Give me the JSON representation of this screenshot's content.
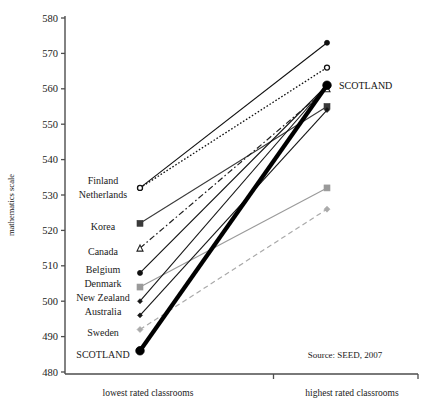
{
  "chart_data": {
    "type": "line",
    "title": "",
    "subtitle": "",
    "xlabel": "",
    "ylabel": "mathematics scale",
    "categories": [
      "lowest rated classrooms",
      "highest rated classrooms"
    ],
    "x": [
      0,
      1
    ],
    "ylim": [
      480,
      580
    ],
    "yticks": [
      480,
      490,
      500,
      510,
      520,
      530,
      540,
      550,
      560,
      570,
      580
    ],
    "ytick_labels": [
      "480",
      "490",
      "500",
      "510",
      "520",
      "530",
      "540",
      "550",
      "560",
      "570",
      "580"
    ],
    "grid": false,
    "legend": "none",
    "annotations": [
      {
        "text": "SCOTLAND",
        "x": 1,
        "y": 561,
        "position": "right-of-point"
      },
      {
        "text": "Source: SEED, 2007",
        "x": 0.78,
        "y": 485,
        "position": "inside-bottom-right"
      }
    ],
    "left_axis_country_labels": [
      {
        "label": "Finland",
        "y": 534
      },
      {
        "label": "Netherlands",
        "y": 530
      },
      {
        "label": "Korea",
        "y": 521
      },
      {
        "label": "Canada",
        "y": 514
      },
      {
        "label": "Belgium",
        "y": 509
      },
      {
        "label": "Denmark",
        "y": 505
      },
      {
        "label": "New Zealand",
        "y": 501
      },
      {
        "label": "Australia",
        "y": 497
      },
      {
        "label": "Sweden",
        "y": 491
      },
      {
        "label": "SCOTLAND",
        "y": 485
      }
    ],
    "series": [
      {
        "name": "Finland",
        "values": [
          532,
          573
        ],
        "marker": "circle-filled",
        "color": "#101010",
        "line": "solid",
        "width": 1.1,
        "marker_size": 5.0
      },
      {
        "name": "Netherlands",
        "values": [
          532,
          566
        ],
        "marker": "circle-open",
        "color": "#101010",
        "line": "dotted",
        "width": 1.3,
        "marker_size": 5.0
      },
      {
        "name": "Korea",
        "values": [
          522,
          555
        ],
        "marker": "square-filled",
        "color": "#3a3a3a",
        "line": "solid",
        "width": 1.1,
        "marker_size": 6.0
      },
      {
        "name": "Canada",
        "values": [
          515,
          560
        ],
        "marker": "triangle-open",
        "color": "#202020",
        "line": "dashdot",
        "width": 1.2,
        "marker_size": 6.0
      },
      {
        "name": "Belgium",
        "values": [
          508,
          561
        ],
        "marker": "circle-filled",
        "color": "#101010",
        "line": "solid",
        "width": 1.1,
        "marker_size": 5.0
      },
      {
        "name": "Denmark",
        "values": [
          504,
          532
        ],
        "marker": "square-filled",
        "color": "#9a9a9a",
        "line": "solid",
        "width": 1.1,
        "marker_size": 6.0
      },
      {
        "name": "New Zealand",
        "values": [
          500,
          561
        ],
        "marker": "diamond-filled",
        "color": "#151515",
        "line": "solid",
        "width": 1.1,
        "marker_size": 5.0
      },
      {
        "name": "Australia",
        "values": [
          496,
          554
        ],
        "marker": "diamond-filled",
        "color": "#151515",
        "line": "solid",
        "width": 1.1,
        "marker_size": 5.0
      },
      {
        "name": "Sweden",
        "values": [
          492,
          526
        ],
        "marker": "diamond-filled",
        "color": "#aaaaaa",
        "line": "dashed",
        "width": 1.2,
        "marker_size": 6.0
      },
      {
        "name": "SCOTLAND",
        "values": [
          486,
          561
        ],
        "marker": "circle-filled",
        "color": "#000000",
        "line": "solid",
        "width": 4.2,
        "marker_size": 8.5
      }
    ]
  }
}
